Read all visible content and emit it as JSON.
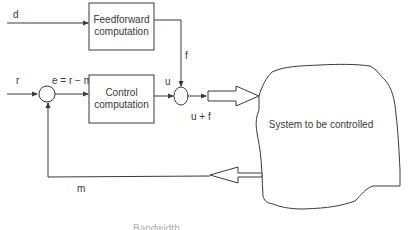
{
  "diagram": {
    "signals": {
      "disturbance": "d",
      "reference": "r",
      "error": "e = r − m",
      "control_output": "u",
      "feedforward_output": "f",
      "combined_output": "u + f",
      "measurement": "m"
    },
    "blocks": {
      "feedforward": {
        "line1": "Feedforward",
        "line2": "computation"
      },
      "control": {
        "line1": "Control",
        "line2": "computation"
      },
      "system": {
        "label": "System to be controlled"
      }
    },
    "summing_junctions": [
      "error-junction",
      "output-junction"
    ],
    "bottom_cutoff_text": "Bandwidth"
  },
  "colors": {
    "line": "#3a3a3a",
    "background": "#ffffff"
  }
}
